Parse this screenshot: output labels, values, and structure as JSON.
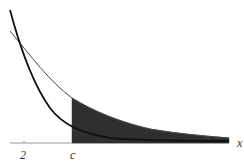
{
  "diagram": {
    "labels": {
      "tick_2": "2",
      "tick_c": "c",
      "axis_x": "x"
    },
    "colors": {
      "shade": "#2f2f2f",
      "thick_curve": "#1a1a1a",
      "thin_curve": "#555555",
      "axis": "#888888",
      "text": "#333333"
    }
  }
}
